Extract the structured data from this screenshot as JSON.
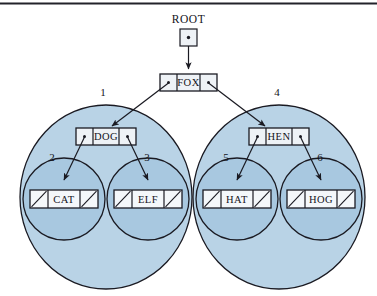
{
  "figure": {
    "kind": "binary-search-tree-pointer-diagram",
    "top_rule": true,
    "colors": {
      "outer_circle_fill": "#b9d3e6",
      "inner_circle_fill": "#a8c8e0",
      "node_box_fill": "#eef2f6",
      "stroke": "#1a1a22",
      "background": "#ffffff",
      "text": "#13131a"
    }
  },
  "root_pointer": {
    "label": "ROOT",
    "cell_symbol": "•"
  },
  "nodes": [
    {
      "id": "fox",
      "key": "FOX",
      "left_cell": "pointer",
      "right_cell": "pointer"
    },
    {
      "id": "dog",
      "key": "DOG",
      "left_cell": "pointer",
      "right_cell": "pointer"
    },
    {
      "id": "hen",
      "key": "HEN",
      "left_cell": "pointer",
      "right_cell": "pointer"
    },
    {
      "id": "cat",
      "key": "CAT",
      "left_cell": "null",
      "right_cell": "null"
    },
    {
      "id": "elf",
      "key": "ELF",
      "left_cell": "null",
      "right_cell": "null"
    },
    {
      "id": "hat",
      "key": "HAT",
      "left_cell": "null",
      "right_cell": "null"
    },
    {
      "id": "hog",
      "key": "HOG",
      "left_cell": "null",
      "right_cell": "null"
    }
  ],
  "subtree_labels": {
    "dog_subtree": "1",
    "cat_subtree": "2",
    "elf_subtree": "3",
    "hen_subtree": "4",
    "hat_subtree": "5",
    "hog_subtree": "6"
  },
  "edges": [
    {
      "from": "root_pointer",
      "to": "fox"
    },
    {
      "from": "fox.left",
      "to": "dog"
    },
    {
      "from": "fox.right",
      "to": "hen"
    },
    {
      "from": "dog.left",
      "to": "cat"
    },
    {
      "from": "dog.right",
      "to": "elf"
    },
    {
      "from": "hen.left",
      "to": "hat"
    },
    {
      "from": "hen.right",
      "to": "hog"
    }
  ]
}
